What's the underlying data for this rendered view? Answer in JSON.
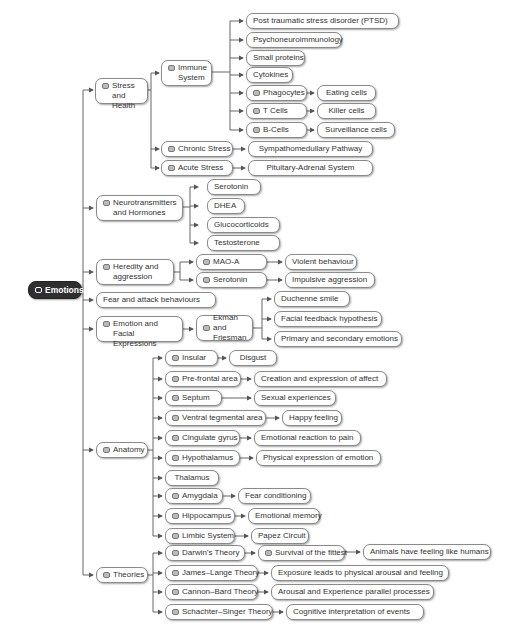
{
  "root": {
    "label": "Emotions"
  },
  "branches": {
    "stress": {
      "label": "Stress and Health",
      "immune": {
        "label": "Immune System",
        "children": [
          "Post traumatic stress disorder (PTSD)",
          "Psychoneuroimmunology",
          "Small proteins",
          "Cytokines"
        ],
        "phagocytes": {
          "label": "Phagocytes",
          "child": "Eating cells"
        },
        "tcells": {
          "label": "T Cells",
          "child": "Killer cells"
        },
        "bcells": {
          "label": "B-Cells",
          "child": "Surveillance cells"
        }
      },
      "chronic": {
        "label": "Chronic Stress",
        "child": "Sympathomedullary Pathway"
      },
      "acute": {
        "label": "Acute Stress",
        "child": "Pituitary-Adrenal System"
      }
    },
    "neuro": {
      "label": "Neurotransmitters and Hormones",
      "children": [
        "Serotonin",
        "DHEA",
        "Glucocorticoids",
        "Testosterone"
      ]
    },
    "heredity": {
      "label": "Heredity and aggression",
      "maoa": {
        "label": "MAO-A",
        "child": "Violent behaviour"
      },
      "serotonin": {
        "label": "Serotonin",
        "child": "Impulsive aggression"
      }
    },
    "fear": {
      "label": "Fear and attack behaviours"
    },
    "facial": {
      "label": "Emotion and Facial Expressions",
      "ekman": {
        "label": "Ekman and Friesman",
        "children": [
          "Duchenne smile",
          "Facial feedback hypothesis",
          "Primary and secondary emotions"
        ]
      }
    },
    "anatomy": {
      "label": "Anatomy",
      "items": [
        {
          "label": "Insular",
          "child": "Disgust"
        },
        {
          "label": "Pre-frontal area",
          "child": "Creation and expression of affect"
        },
        {
          "label": "Septum",
          "child": "Sexual experiences"
        },
        {
          "label": "Ventral tegmental area",
          "child": "Happy feeling"
        },
        {
          "label": "Cingulate gyrus",
          "child": "Emotional reaction to pain"
        },
        {
          "label": "Hypothalamus",
          "child": "Physical expression of emotion"
        },
        {
          "label": "Thalamus",
          "child": null
        },
        {
          "label": "Amygdala",
          "child": "Fear conditioning"
        },
        {
          "label": "Hippocampus",
          "child": "Emotional memory"
        },
        {
          "label": "Limbic System",
          "child": "Papez Circuit"
        }
      ]
    },
    "theories": {
      "label": "Theories",
      "darwin": {
        "label": "Darwin's Theory",
        "child": "Survival of the fittest",
        "grandchild": "Animals have feeling like humans"
      },
      "james": {
        "label": "James–Lange Theory",
        "child": "Exposure leads to physical arousal and feeling"
      },
      "cannon": {
        "label": "Cannon–Bard Theory",
        "child": "Arousal and Experience parallel processes"
      },
      "schachter": {
        "label": "Schachter–Singer Theory",
        "child": "Cognitive interpretation of events"
      }
    }
  },
  "colors": {
    "root_bg": "#2f2f2f",
    "node_border": "#8a8a8a",
    "line": "#555555"
  }
}
